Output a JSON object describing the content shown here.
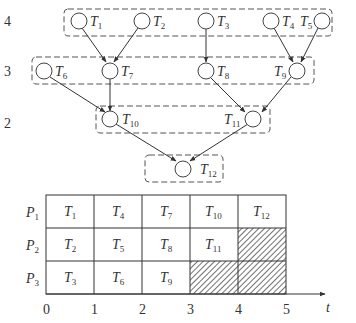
{
  "dag": {
    "levels": [
      {
        "label": "4",
        "tasks": [
          "T1",
          "T2",
          "T3",
          "T4",
          "T5"
        ]
      },
      {
        "label": "3",
        "tasks": [
          "T6",
          "T7",
          "T8",
          "T9"
        ]
      },
      {
        "label": "2",
        "tasks": [
          "T10",
          "T11"
        ]
      },
      {
        "label": "",
        "tasks": [
          "T12"
        ]
      }
    ],
    "nodes": [
      {
        "id": "T1",
        "base": "T",
        "sub": "1"
      },
      {
        "id": "T2",
        "base": "T",
        "sub": "2"
      },
      {
        "id": "T3",
        "base": "T",
        "sub": "3"
      },
      {
        "id": "T4",
        "base": "T",
        "sub": "4"
      },
      {
        "id": "T5",
        "base": "T",
        "sub": "5"
      },
      {
        "id": "T6",
        "base": "T",
        "sub": "6"
      },
      {
        "id": "T7",
        "base": "T",
        "sub": "7"
      },
      {
        "id": "T8",
        "base": "T",
        "sub": "8"
      },
      {
        "id": "T9",
        "base": "T",
        "sub": "9"
      },
      {
        "id": "T10",
        "base": "T",
        "sub": "10"
      },
      {
        "id": "T11",
        "base": "T",
        "sub": "11"
      },
      {
        "id": "T12",
        "base": "T",
        "sub": "12"
      }
    ],
    "edges": [
      [
        "T1",
        "T7"
      ],
      [
        "T2",
        "T7"
      ],
      [
        "T3",
        "T8"
      ],
      [
        "T4",
        "T9"
      ],
      [
        "T5",
        "T9"
      ],
      [
        "T6",
        "T10"
      ],
      [
        "T7",
        "T10"
      ],
      [
        "T8",
        "T11"
      ],
      [
        "T9",
        "T11"
      ],
      [
        "T10",
        "T12"
      ],
      [
        "T11",
        "T12"
      ]
    ]
  },
  "gantt": {
    "processors": [
      {
        "base": "P",
        "sub": "1",
        "cells": [
          [
            "T",
            "1"
          ],
          [
            "T",
            "4"
          ],
          [
            "T",
            "7"
          ],
          [
            "T",
            "10"
          ],
          [
            "T",
            "12"
          ]
        ]
      },
      {
        "base": "P",
        "sub": "2",
        "cells": [
          [
            "T",
            "2"
          ],
          [
            "T",
            "5"
          ],
          [
            "T",
            "8"
          ],
          [
            "T",
            "11"
          ],
          null
        ]
      },
      {
        "base": "P",
        "sub": "3",
        "cells": [
          [
            "T",
            "3"
          ],
          [
            "T",
            "6"
          ],
          [
            "T",
            "9"
          ],
          null,
          null
        ]
      }
    ],
    "idle_note": "hatched = idle",
    "axis": {
      "ticks": [
        "0",
        "1",
        "2",
        "3",
        "4",
        "5"
      ],
      "label": "t"
    }
  }
}
